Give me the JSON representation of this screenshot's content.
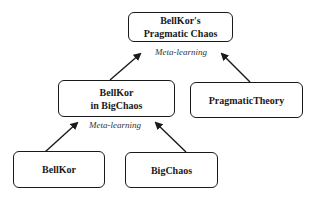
{
  "diagram": {
    "type": "tree",
    "direction": "bottom-to-top",
    "nodes": {
      "root": {
        "line1": "BellKor's",
        "line2": "Pragmatic Chaos"
      },
      "mid": {
        "line1": "BellKor",
        "line2": "in BigChaos"
      },
      "pragmatic": {
        "label": "PragmaticTheory"
      },
      "bellkor": {
        "label": "BellKor"
      },
      "bigchaos": {
        "label": "BigChaos"
      }
    },
    "edge_labels": {
      "root_combiner": "Meta-learning",
      "mid_combiner": "Meta-learning"
    },
    "edges": [
      {
        "from": "BellKor in BigChaos",
        "to": "BellKor's Pragmatic Chaos"
      },
      {
        "from": "PragmaticTheory",
        "to": "BellKor's Pragmatic Chaos"
      },
      {
        "from": "BellKor",
        "to": "BellKor in BigChaos"
      },
      {
        "from": "BigChaos",
        "to": "BellKor in BigChaos"
      }
    ],
    "colors": {
      "stroke": "#1a1a1a",
      "background": "#ffffff"
    }
  }
}
